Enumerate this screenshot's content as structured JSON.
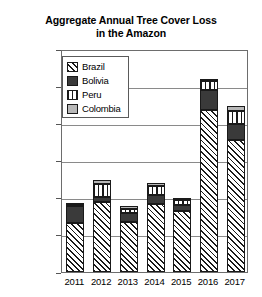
{
  "chart_data": {
    "type": "bar",
    "subtype": "stacked-vertical",
    "title": "Aggregate Annual Tree Cover Loss in the Amazon",
    "title_line1": "Aggregate Annual Tree Cover Loss",
    "title_line2": "in the Amazon",
    "xlabel": "",
    "ylabel": "",
    "categories": [
      "2011",
      "2012",
      "2013",
      "2014",
      "2015",
      "2016",
      "2017"
    ],
    "ylim": [
      0,
      6000000
    ],
    "ytick_labels": [
      "6000000",
      "5000000",
      "4000000",
      "3000000",
      "2000000",
      "1000000",
      "0"
    ],
    "ytick_values": [
      6000000,
      5000000,
      4000000,
      3000000,
      2000000,
      1000000,
      0
    ],
    "grid": true,
    "grid_axis": "y",
    "legend_position": "upper-left-inside",
    "series": [
      {
        "name": "Brazil",
        "pattern": "diagonal-hatch",
        "color": "#ffffff",
        "values": [
          1310000,
          1880000,
          1350000,
          1830000,
          1640000,
          4350000,
          3550000
        ]
      },
      {
        "name": "Bolivia",
        "pattern": "solid-dark",
        "color": "#3a3a3a",
        "values": [
          460000,
          130000,
          240000,
          240000,
          160000,
          560000,
          430000
        ]
      },
      {
        "name": "Peru",
        "pattern": "vertical-hatch",
        "color": "#ffffff",
        "values": [
          20000,
          350000,
          100000,
          240000,
          140000,
          220000,
          350000
        ]
      },
      {
        "name": "Colombia",
        "pattern": "solid-light-gray",
        "color": "#b8b8b8",
        "values": [
          10000,
          110000,
          80000,
          80000,
          50000,
          20000,
          140000
        ]
      }
    ],
    "totals": [
      1800000,
      2470000,
      1770000,
      2390000,
      1990000,
      5150000,
      4470000
    ]
  },
  "legend": {
    "items": [
      {
        "label": "Brazil"
      },
      {
        "label": "Bolivia"
      },
      {
        "label": "Peru"
      },
      {
        "label": "Colombia"
      }
    ]
  }
}
